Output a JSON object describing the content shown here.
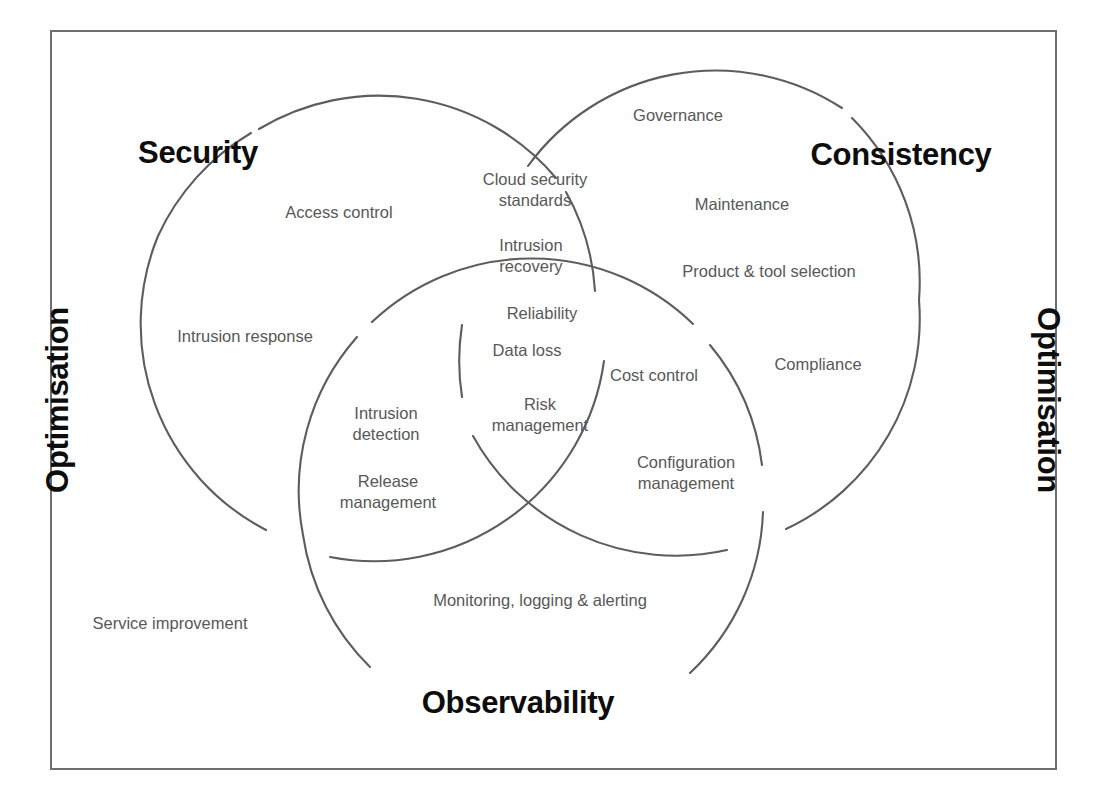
{
  "diagram": {
    "type": "venn-3-circle",
    "border_color": "#6e6e6e",
    "circle_stroke_color": "#5d5d5d",
    "title_color": "#0d0d0d",
    "label_color": "#585858",
    "background": "#ffffff"
  },
  "side_labels": {
    "left": "Optimisation",
    "right": "Optimisation"
  },
  "circles": [
    {
      "id": "security",
      "title": "Security"
    },
    {
      "id": "consistency",
      "title": "Consistency"
    },
    {
      "id": "observability",
      "title": "Observability"
    }
  ],
  "labels": [
    {
      "id": "governance",
      "text": "Governance",
      "region": "consistency-only"
    },
    {
      "id": "access-control",
      "text": "Access control",
      "region": "security-only"
    },
    {
      "id": "cloud-security",
      "text": "Cloud security\nstandards",
      "region": "security-consistency"
    },
    {
      "id": "maintenance",
      "text": "Maintenance",
      "region": "consistency-only"
    },
    {
      "id": "intrusion-recovery",
      "text": "Intrusion\nrecovery",
      "region": "security-consistency"
    },
    {
      "id": "product-tool",
      "text": "Product & tool selection",
      "region": "consistency-only"
    },
    {
      "id": "intrusion-response",
      "text": "Intrusion response",
      "region": "security-only"
    },
    {
      "id": "reliability",
      "text": "Reliability",
      "region": "all-three"
    },
    {
      "id": "data-loss",
      "text": "Data loss",
      "region": "all-three"
    },
    {
      "id": "cost-control",
      "text": "Cost control",
      "region": "consistency-observability"
    },
    {
      "id": "compliance",
      "text": "Compliance",
      "region": "consistency-only"
    },
    {
      "id": "intrusion-detection",
      "text": "Intrusion\ndetection",
      "region": "security-observability"
    },
    {
      "id": "risk-management",
      "text": "Risk\nmanagement",
      "region": "all-three"
    },
    {
      "id": "configuration-mgmt",
      "text": "Configuration\nmanagement",
      "region": "consistency-observability"
    },
    {
      "id": "release-management",
      "text": "Release\nmanagement",
      "region": "security-observability"
    },
    {
      "id": "monitoring",
      "text": "Monitoring, logging & alerting",
      "region": "observability-only"
    },
    {
      "id": "service-improvement",
      "text": "Service improvement",
      "region": "outside"
    }
  ]
}
